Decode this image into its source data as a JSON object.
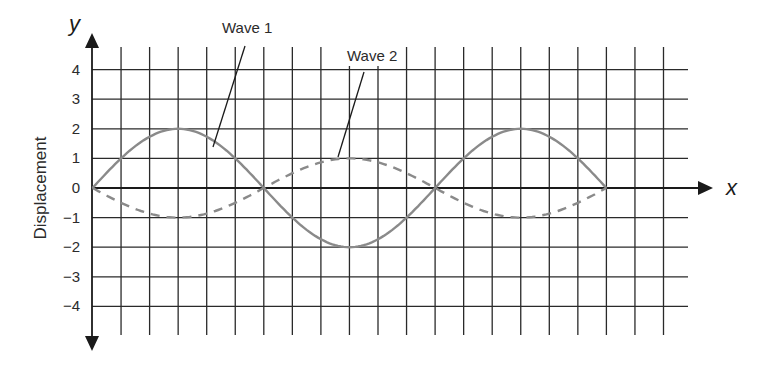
{
  "chart_data": {
    "type": "line",
    "title": "",
    "xlabel": "x",
    "ylabel": "Displacement",
    "y_axis_var": "y",
    "x_axis_var": "x",
    "yticks": [
      "4",
      "3",
      "2",
      "1",
      "0",
      "−1",
      "−2",
      "−3",
      "−4"
    ],
    "ytick_values": [
      4,
      3,
      2,
      1,
      0,
      -1,
      -2,
      -3,
      -4
    ],
    "ylim": [
      -4,
      4
    ],
    "x_grid_units": 20,
    "grid": true,
    "x": [
      0,
      1,
      2,
      3,
      4,
      5,
      6,
      7,
      8,
      9,
      10,
      11,
      12,
      13,
      14,
      15,
      16,
      17,
      18
    ],
    "series": [
      {
        "name": "Wave 1",
        "style": "solid",
        "color": "#8a8a8a",
        "amplitude": 2,
        "values": [
          0,
          1,
          1.73,
          2,
          1.73,
          1,
          0,
          -1,
          -1.73,
          -2,
          -1.73,
          -1,
          0,
          1,
          1.73,
          2,
          1.73,
          1,
          0
        ]
      },
      {
        "name": "Wave 2",
        "style": "dashed",
        "color": "#8a8a8a",
        "amplitude": 1,
        "values": [
          0,
          -0.5,
          -0.87,
          -1,
          -0.87,
          -0.5,
          0,
          0.5,
          0.87,
          1,
          0.87,
          0.5,
          0,
          -0.5,
          -0.87,
          -1,
          -0.87,
          -0.5,
          0
        ]
      }
    ],
    "annotations": [
      {
        "text": "Wave 1",
        "points_to": "Wave 1 descending near x=4"
      },
      {
        "text": "Wave 2",
        "points_to": "Wave 2 crest near x=8.5"
      }
    ],
    "legend": "none (callout labels)"
  },
  "labels": {
    "y_var": "y",
    "x_var": "x",
    "ylabel": "Displacement",
    "wave1": "Wave 1",
    "wave2": "Wave 2",
    "ticks": [
      "4",
      "3",
      "2",
      "1",
      "0",
      "−1",
      "−2",
      "−3",
      "−4"
    ]
  },
  "colors": {
    "grid": "#2a2a2a",
    "wave": "#8a8a8a",
    "axis": "#1a1a1a"
  }
}
